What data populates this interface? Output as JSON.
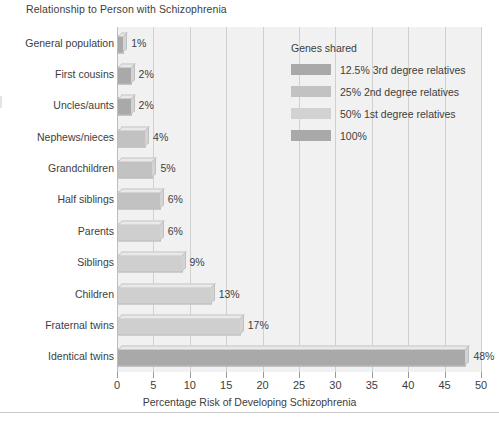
{
  "chart_data": {
    "type": "bar",
    "orientation": "horizontal",
    "title": "Relationship to Person with Schizophrenia",
    "xlabel": "Percentage Risk of Developing Schizophrenia",
    "ylabel": "",
    "xlim": [
      0,
      50
    ],
    "xticks": [
      0,
      5,
      10,
      15,
      20,
      25,
      30,
      35,
      40,
      45,
      50
    ],
    "xtick_labels": [
      "0",
      "5",
      "10",
      "15",
      "20",
      "25",
      "30",
      "35",
      "40",
      "45",
      "50"
    ],
    "grid": "vertical",
    "legend_position": "upper-right-inside",
    "categories": [
      "General population",
      "First cousins",
      "Uncles/aunts",
      "Nephews/nieces",
      "Grandchildren",
      "Half siblings",
      "Parents",
      "Siblings",
      "Children",
      "Fraternal twins",
      "Identical twins"
    ],
    "values": [
      1,
      2,
      2,
      4,
      5,
      6,
      6,
      9,
      13,
      17,
      48
    ],
    "value_labels": [
      "1%",
      "2%",
      "2%",
      "4%",
      "5%",
      "6%",
      "6%",
      "9%",
      "13%",
      "17%",
      "48%"
    ],
    "group_of_bar": [
      "12.5% 3rd degree relatives",
      "12.5% 3rd degree relatives",
      "12.5% 3rd degree relatives",
      "25% 2nd degree relatives",
      "25% 2nd degree relatives",
      "25% 2nd degree relatives",
      "50% 1st degree relatives",
      "50% 1st degree relatives",
      "50% 1st degree relatives",
      "50% 1st degree relatives",
      "100%"
    ],
    "bar_colors": [
      "#a9a9a9",
      "#a9a9a9",
      "#a9a9a9",
      "#c2c2c2",
      "#c2c2c2",
      "#c2c2c2",
      "#cfcfcf",
      "#cfcfcf",
      "#cfcfcf",
      "#cfcfcf",
      "#a9a9a9"
    ],
    "legend": {
      "title": "Genes shared",
      "entries": [
        {
          "label": "12.5% 3rd degree relatives",
          "color": "#a9a9a9"
        },
        {
          "label": "25% 2nd degree relatives",
          "color": "#c2c2c2"
        },
        {
          "label": "50% 1st degree relatives",
          "color": "#d2d2d2"
        },
        {
          "label": "100%",
          "color": "#a9a9a9"
        }
      ]
    },
    "colors": {
      "plot_background": "#f1f1f1",
      "gridline": "#d0d0d0",
      "text": "#3d3d3d",
      "page_background": "#ffffff"
    }
  }
}
